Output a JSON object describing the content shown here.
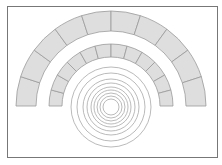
{
  "diagram": {
    "frame": {
      "x": 7.5,
      "y": 6.5,
      "width": 210,
      "height": 151,
      "stroke": "#777777"
    },
    "center": {
      "x": 111,
      "y": 107
    },
    "colors": {
      "stone_fill": "#dedede",
      "stone_stroke": "#9a9a9a",
      "circle_stroke": "#a8a8a8"
    },
    "outer_arch": {
      "outer_radius": 95,
      "inner_radius": 75,
      "stones": 10,
      "base_y": 106
    },
    "inner_arch": {
      "outer_radius": 62,
      "inner_radius": 49,
      "stones": 12,
      "base_y": 106
    },
    "circles": {
      "radii": [
        40,
        34,
        28,
        24,
        20,
        17,
        14,
        11,
        8
      ]
    }
  }
}
